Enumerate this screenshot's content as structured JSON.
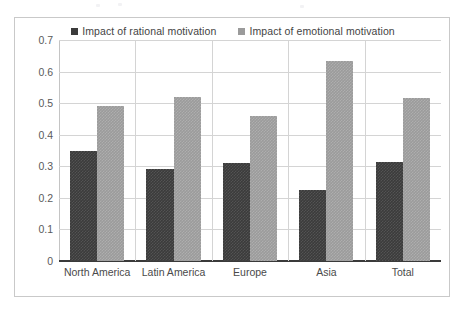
{
  "chart_data": {
    "type": "bar",
    "title": "",
    "subtitle": "",
    "xlabel": "",
    "ylabel": "",
    "categories": [
      "North America",
      "Latin America",
      "Europe",
      "Asia",
      "Total"
    ],
    "series": [
      {
        "name": "Impact of rational motivation",
        "color": "#3b3b3b",
        "values": [
          0.35,
          0.29,
          0.31,
          0.225,
          0.315
        ]
      },
      {
        "name": "Impact of emotional motivation",
        "color": "#9b9b9b",
        "values": [
          0.49,
          0.52,
          0.46,
          0.635,
          0.515
        ]
      }
    ],
    "ylim": [
      0,
      0.7
    ],
    "ytick_values": [
      0,
      0.1,
      0.2,
      0.3,
      0.4,
      0.5,
      0.6,
      0.7
    ],
    "ytick_labels": [
      "0",
      "0.1",
      "0.2",
      "0.3",
      "0.4",
      "0.5",
      "0.6",
      "0.7"
    ],
    "grid": "horizontal-and-vertical",
    "legend_position": "top-center",
    "annotations": []
  },
  "legend": {
    "items": [
      {
        "label": "Impact of rational motivation",
        "swatch_icon": "legend-square-dark",
        "color": "#3b3b3b"
      },
      {
        "label": "Impact of emotional motivation",
        "swatch_icon": "legend-square-light",
        "color": "#9b9b9b"
      }
    ]
  },
  "frame": {
    "border_color": "#c9c9c9",
    "background": "#ffffff",
    "gridline_color": "#d4d4d4",
    "axis_color": "#3a3a3a"
  }
}
